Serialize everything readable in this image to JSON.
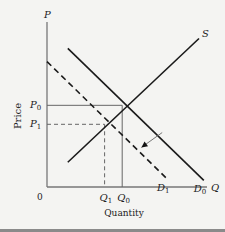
{
  "chart_data": {
    "type": "line",
    "title": "",
    "xlabel": "Quantity",
    "ylabel": "Price",
    "axis_labels": {
      "x": "Q",
      "y": "P"
    },
    "origin_label": "0",
    "xlim": [
      0,
      10
    ],
    "ylim": [
      0,
      10
    ],
    "series": [
      {
        "name": "S",
        "label": "S",
        "style": "solid",
        "points": [
          [
            1.3,
            1.5
          ],
          [
            9.5,
            9.0
          ]
        ]
      },
      {
        "name": "D0",
        "label": "D",
        "sub": "0",
        "style": "solid",
        "points": [
          [
            1.3,
            8.4
          ],
          [
            9.8,
            0.4
          ]
        ]
      },
      {
        "name": "D1",
        "label": "D",
        "sub": "1",
        "style": "dashed",
        "points": [
          [
            0.0,
            7.6
          ],
          [
            7.5,
            0.5
          ]
        ]
      }
    ],
    "equilibria": [
      {
        "name": "E0",
        "price_label": "P",
        "price_sub": "0",
        "qty_label": "Q",
        "qty_sub": "0",
        "x": 4.7,
        "y": 4.95,
        "guide_style": "solid"
      },
      {
        "name": "E1",
        "price_label": "P",
        "price_sub": "1",
        "qty_label": "Q",
        "qty_sub": "1",
        "x": 3.6,
        "y": 3.8,
        "guide_style": "dashed"
      }
    ],
    "annotations": [
      {
        "type": "arrow",
        "meaning": "demand shifts left from D0 to D1",
        "from": [
          7.2,
          3.3
        ],
        "to": [
          5.9,
          2.4
        ]
      }
    ]
  }
}
